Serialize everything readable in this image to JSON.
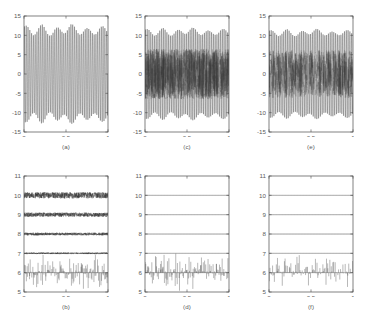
{
  "figure": {
    "title": "",
    "background": "#ffffff",
    "rows": 2,
    "cols": 3,
    "panel_order": "column-major"
  },
  "colors": {
    "axis": "#4a4a4a",
    "trace": "#2c2c2c",
    "trace_light": "#6a6a6a",
    "text": "#5a5a5a",
    "background": "#ffffff"
  },
  "captions": {
    "a": "(a)",
    "b": "(b)",
    "c": "(c)",
    "d": "(d)",
    "e": "(e)",
    "f": "(f)"
  },
  "chart_data": [
    {
      "id": "a",
      "type": "line",
      "title": "(a)",
      "xlabel": "",
      "ylabel": "",
      "xlim": [
        0,
        1
      ],
      "ylim": [
        -15,
        15
      ],
      "xticks": [
        0,
        0.5,
        1
      ],
      "xticklabels": [
        "0",
        "0.5",
        "1"
      ],
      "yticks": [
        -15,
        -10,
        -5,
        0,
        5,
        10,
        15
      ],
      "yticklabels": [
        "-15",
        "-10",
        "-5",
        "0",
        "5",
        "10",
        "15"
      ],
      "grid": false,
      "legend": null,
      "description": "Dense amplitude-modulated oscillation, clean chirp-like carrier",
      "series": [
        {
          "name": "signal",
          "kind": "oscillation",
          "cycles": 47,
          "amplitude_envelope": [
            11.6,
            11.0,
            11.8,
            10.6,
            11.4,
            11.9,
            11.2,
            10.8,
            11.5,
            11.1
          ],
          "beat_amplitude": 1.1,
          "noise_level": 0.0,
          "color": "#2c2c2c"
        }
      ]
    },
    {
      "id": "b",
      "type": "line",
      "title": "(b)",
      "xlabel": "",
      "ylabel": "",
      "xlim": [
        0,
        1
      ],
      "ylim": [
        5,
        11
      ],
      "xticks": [
        0,
        0.5,
        1
      ],
      "xticklabels": [
        "0",
        "0.5",
        "1"
      ],
      "yticks": [
        5,
        6,
        7,
        8,
        9,
        10,
        11
      ],
      "yticklabels": [
        "5",
        "6",
        "7",
        "8",
        "9",
        "10",
        "11"
      ],
      "grid": false,
      "legend": null,
      "description": "Decomposition levels offset at 10, 9, 8, 7 with noise jitter; detail spikes about baseline 6",
      "series": [
        {
          "name": "level-1",
          "kind": "noisy-flat",
          "offset": 10,
          "noise_level": 0.16,
          "color": "#2c2c2c"
        },
        {
          "name": "level-2",
          "kind": "noisy-flat",
          "offset": 9,
          "noise_level": 0.11,
          "color": "#2c2c2c"
        },
        {
          "name": "level-3",
          "kind": "noisy-flat",
          "offset": 8,
          "noise_level": 0.07,
          "color": "#2c2c2c"
        },
        {
          "name": "level-4",
          "kind": "noisy-flat",
          "offset": 7,
          "noise_level": 0.04,
          "color": "#4f4f4f"
        },
        {
          "name": "detail-spikes",
          "kind": "spikes",
          "offset": 6,
          "spike_up_max": 0.95,
          "spike_down_max": 0.72,
          "spike_count": 150,
          "color": "#2c2c2c"
        }
      ]
    },
    {
      "id": "c",
      "type": "line",
      "title": "(c)",
      "xlabel": "",
      "ylabel": "",
      "xlim": [
        0,
        1
      ],
      "ylim": [
        -15,
        15
      ],
      "xticks": [
        0,
        0.5,
        1
      ],
      "xticklabels": [
        "0",
        "0.5",
        "1"
      ],
      "yticks": [
        -15,
        -10,
        -5,
        0,
        5,
        10,
        15
      ],
      "yticklabels": [
        "-15",
        "-10",
        "-5",
        "0",
        "5",
        "10",
        "15"
      ],
      "grid": false,
      "legend": null,
      "description": "Same carrier as (a) corrupted by heavy broadband noise filling the central band",
      "series": [
        {
          "name": "signal",
          "kind": "oscillation",
          "cycles": 47,
          "amplitude_envelope": [
            11.0,
            10.6,
            11.2,
            10.4,
            11.0,
            11.3,
            10.8,
            10.5,
            11.1,
            10.7
          ],
          "beat_amplitude": 0.8,
          "noise_level": 0.0,
          "color": "#2c2c2c"
        },
        {
          "name": "noise",
          "kind": "dense-noise",
          "band": [
            -6.5,
            6.5
          ],
          "density": 950,
          "color": "#3d3d3d"
        }
      ]
    },
    {
      "id": "d",
      "type": "line",
      "title": "(d)",
      "xlabel": "",
      "ylabel": "",
      "xlim": [
        0,
        1
      ],
      "ylim": [
        5,
        11
      ],
      "xticks": [
        0,
        0.5,
        1
      ],
      "xticklabels": [
        "0",
        "0.5",
        "1"
      ],
      "yticks": [
        5,
        6,
        7,
        8,
        9,
        10,
        11
      ],
      "yticklabels": [
        "5",
        "6",
        "7",
        "8",
        "9",
        "10",
        "11"
      ],
      "grid": false,
      "legend": null,
      "description": "Denoised decomposition: flat approximation levels at 10, 9, 8, 7 and residual detail spikes at 6",
      "series": [
        {
          "name": "level-1",
          "kind": "noisy-flat",
          "offset": 10,
          "noise_level": 0.0,
          "color": "#4f4f4f"
        },
        {
          "name": "level-2",
          "kind": "noisy-flat",
          "offset": 9,
          "noise_level": 0.0,
          "color": "#4f4f4f"
        },
        {
          "name": "level-3",
          "kind": "noisy-flat",
          "offset": 8,
          "noise_level": 0.0,
          "color": "#4f4f4f"
        },
        {
          "name": "level-4",
          "kind": "noisy-flat",
          "offset": 7,
          "noise_level": 0.0,
          "color": "#4f4f4f"
        },
        {
          "name": "detail-spikes",
          "kind": "spikes",
          "offset": 6,
          "spike_up_max": 0.92,
          "spike_down_max": 0.78,
          "spike_count": 140,
          "color": "#2c2c2c"
        }
      ]
    },
    {
      "id": "e",
      "type": "line",
      "title": "(e)",
      "xlabel": "",
      "ylabel": "",
      "xlim": [
        0,
        1
      ],
      "ylim": [
        -15,
        15
      ],
      "xticks": [
        0,
        0.5,
        1
      ],
      "xticklabels": [
        "0",
        "0.5",
        "1"
      ],
      "yticks": [
        -15,
        -10,
        -5,
        0,
        5,
        10,
        15
      ],
      "yticklabels": [
        "-15",
        "-10",
        "-5",
        "0",
        "5",
        "10",
        "15"
      ],
      "grid": false,
      "legend": null,
      "description": "Carrier with sparser impulsive noise in the central band",
      "series": [
        {
          "name": "signal",
          "kind": "oscillation",
          "cycles": 47,
          "amplitude_envelope": [
            10.8,
            10.4,
            11.0,
            10.2,
            10.8,
            11.1,
            10.6,
            10.3,
            10.9,
            10.5
          ],
          "beat_amplitude": 0.7,
          "noise_level": 0.0,
          "color": "#2c2c2c"
        },
        {
          "name": "noise",
          "kind": "dense-noise",
          "band": [
            -6.2,
            6.2
          ],
          "density": 560,
          "color": "#4a4a4a"
        }
      ]
    },
    {
      "id": "f",
      "type": "line",
      "title": "(f)",
      "xlabel": "",
      "ylabel": "",
      "xlim": [
        0,
        1
      ],
      "ylim": [
        5,
        11
      ],
      "xticks": [
        0,
        0.5,
        1
      ],
      "xticklabels": [
        "0",
        "0.5",
        "1"
      ],
      "yticks": [
        5,
        6,
        7,
        8,
        9,
        10,
        11
      ],
      "yticklabels": [
        "5",
        "6",
        "7",
        "8",
        "9",
        "10",
        "11"
      ],
      "grid": false,
      "legend": null,
      "description": "Denoised decomposition with flat levels at 10, 9, 8, 7 and sparser detail spikes at 6",
      "series": [
        {
          "name": "level-1",
          "kind": "noisy-flat",
          "offset": 10,
          "noise_level": 0.0,
          "color": "#4f4f4f"
        },
        {
          "name": "level-2",
          "kind": "noisy-flat",
          "offset": 9,
          "noise_level": 0.0,
          "color": "#4f4f4f"
        },
        {
          "name": "level-3",
          "kind": "noisy-flat",
          "offset": 8,
          "noise_level": 0.0,
          "color": "#4f4f4f"
        },
        {
          "name": "level-4",
          "kind": "noisy-flat",
          "offset": 7,
          "noise_level": 0.0,
          "color": "#4f4f4f"
        },
        {
          "name": "detail-spikes",
          "kind": "spikes",
          "offset": 6,
          "spike_up_max": 0.88,
          "spike_down_max": 0.7,
          "spike_count": 110,
          "color": "#2c2c2c"
        }
      ]
    }
  ]
}
